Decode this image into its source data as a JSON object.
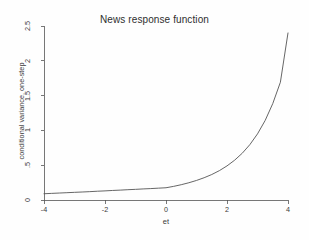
{
  "chart_data": {
    "type": "line",
    "title": "News response function",
    "xlabel": "et",
    "ylabel": "conditional variance, one-step",
    "xlim": [
      -4,
      4
    ],
    "ylim": [
      0,
      2.5
    ],
    "xticks": [
      -4,
      -2,
      0,
      2,
      4
    ],
    "xticklabels": [
      "-4",
      "-2",
      "0",
      "2",
      "4"
    ],
    "yticks": [
      0,
      0.5,
      1,
      1.5,
      2,
      2.5
    ],
    "yticklabels": [
      "0",
      ".5",
      "1",
      "1.5",
      "2",
      "2.5"
    ],
    "grid": false,
    "legend": null,
    "series": [
      {
        "name": "conditional variance, one-step",
        "color": "#555555",
        "linewidth": 0.9,
        "x": [
          -4.0,
          -3.75,
          -3.5,
          -3.25,
          -3.0,
          -2.75,
          -2.5,
          -2.25,
          -2.0,
          -1.75,
          -1.5,
          -1.25,
          -1.0,
          -0.75,
          -0.5,
          -0.25,
          0.0,
          0.25,
          0.5,
          0.75,
          1.0,
          1.25,
          1.5,
          1.75,
          2.0,
          2.25,
          2.5,
          2.75,
          3.0,
          3.25,
          3.5,
          3.75,
          4.0
        ],
        "values": [
          0.09,
          0.095,
          0.1,
          0.105,
          0.11,
          0.115,
          0.12,
          0.126,
          0.131,
          0.137,
          0.142,
          0.148,
          0.153,
          0.159,
          0.164,
          0.17,
          0.176,
          0.196,
          0.22,
          0.248,
          0.281,
          0.32,
          0.366,
          0.422,
          0.49,
          0.572,
          0.672,
          0.796,
          0.95,
          1.142,
          1.385,
          1.692,
          2.4
        ]
      }
    ]
  },
  "axes": {
    "x_spine_color": "#555555",
    "y_spine_color": "#555555",
    "tick_color": "#555555"
  }
}
